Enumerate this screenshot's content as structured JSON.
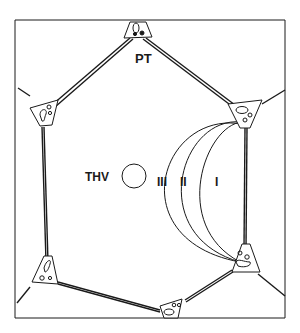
{
  "figure": {
    "type": "liver-lobule-acinus-schematic",
    "labels": {
      "portal_tract": "PT",
      "terminal_hepatic_venule": "THV",
      "zone_1": "I",
      "zone_2": "II",
      "zone_3": "III"
    },
    "colors": {
      "line": "#1a1a1a",
      "background": "#ffffff"
    }
  }
}
